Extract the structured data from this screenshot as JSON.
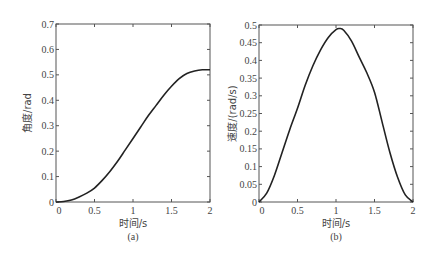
{
  "chart_data": [
    {
      "type": "line",
      "caption": "(a)",
      "title": "",
      "xlabel": "时间/s",
      "ylabel": "角度/rad",
      "xlim": [
        0,
        2
      ],
      "ylim": [
        0,
        0.7
      ],
      "xticks": [
        "0",
        "0.5",
        "1",
        "1.5",
        "2"
      ],
      "yticks": [
        "0",
        "0.1",
        "0.2",
        "0.3",
        "0.4",
        "0.5",
        "0.6",
        "0.7"
      ],
      "grid": false,
      "series": [
        {
          "name": "angle",
          "x": [
            0,
            0.1,
            0.2,
            0.3,
            0.4,
            0.5,
            0.6,
            0.7,
            0.8,
            0.9,
            1.0,
            1.1,
            1.2,
            1.3,
            1.4,
            1.5,
            1.6,
            1.7,
            1.8,
            1.9,
            2.0
          ],
          "y": [
            0,
            0.002,
            0.008,
            0.02,
            0.035,
            0.055,
            0.085,
            0.12,
            0.16,
            0.205,
            0.25,
            0.295,
            0.34,
            0.38,
            0.42,
            0.455,
            0.485,
            0.505,
            0.515,
            0.52,
            0.52
          ]
        }
      ]
    },
    {
      "type": "line",
      "caption": "(b)",
      "title": "",
      "xlabel": "时间/s",
      "ylabel": "速度/(rad/s)",
      "xlim": [
        0,
        2
      ],
      "ylim": [
        0,
        0.5
      ],
      "xticks": [
        "0",
        "0.5",
        "1",
        "1.5",
        "2"
      ],
      "yticks": [
        "0",
        "0.05",
        "0.1",
        "0.15",
        "0.2",
        "0.25",
        "0.3",
        "0.35",
        "0.4",
        "0.45",
        "0.5"
      ],
      "grid": false,
      "series": [
        {
          "name": "velocity",
          "x": [
            0,
            0.1,
            0.2,
            0.3,
            0.4,
            0.5,
            0.6,
            0.7,
            0.8,
            0.9,
            1.0,
            1.05,
            1.1,
            1.2,
            1.3,
            1.4,
            1.5,
            1.6,
            1.7,
            1.8,
            1.9,
            2.0
          ],
          "y": [
            0,
            0.025,
            0.075,
            0.14,
            0.205,
            0.265,
            0.33,
            0.385,
            0.43,
            0.465,
            0.487,
            0.49,
            0.485,
            0.455,
            0.41,
            0.365,
            0.31,
            0.225,
            0.14,
            0.07,
            0.02,
            0
          ]
        }
      ]
    }
  ]
}
